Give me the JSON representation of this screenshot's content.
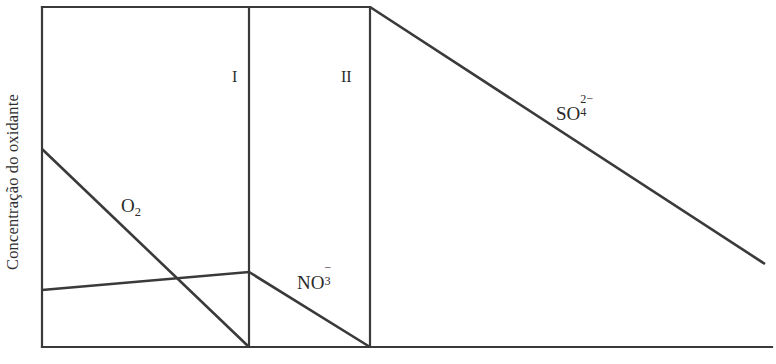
{
  "figure": {
    "background_color": "#ffffff",
    "line_color": "#3a3a3a",
    "text_color": "#2e2e2e",
    "y_axis_title": "Concentração do oxidante",
    "x_axis_title": ""
  },
  "zones": [
    {
      "name": "zone-1",
      "label": "I",
      "x": 232,
      "y": 68
    },
    {
      "name": "zone-2",
      "label": "II",
      "x": 341,
      "y": 68
    }
  ],
  "curve_labels": [
    {
      "name": "o2",
      "base": "O",
      "sub": "2",
      "sup": "",
      "x": 121,
      "y": 196
    },
    {
      "name": "no3",
      "base": "NO",
      "sub": "3",
      "sup": "−",
      "x": 297,
      "y": 270
    },
    {
      "name": "so4",
      "base": "SO",
      "sub": "4",
      "sup": "2−",
      "x": 556,
      "y": 101
    }
  ],
  "chart_data": {
    "type": "line",
    "title": "",
    "xlabel": "",
    "ylabel": "Concentração do oxidante",
    "grid": false,
    "legend": "inline-labels",
    "axes": {
      "x_axis": {
        "x_start": 42,
        "x_end": 772,
        "y": 347,
        "ticks": [],
        "tick_labels": []
      },
      "y_axis": {
        "x": 42,
        "y_top": 7,
        "y_bottom": 347,
        "ticks": [],
        "tick_labels": []
      }
    },
    "frame": {
      "top_line": {
        "x1": 42,
        "y1": 7,
        "x2": 370,
        "y2": 7
      },
      "left_line": {
        "x1": 42,
        "y1": 7,
        "x2": 42,
        "y2": 347
      },
      "bottom_line": {
        "x1": 42,
        "y1": 347,
        "x2": 772,
        "y2": 347
      },
      "divider_1": {
        "x1": 249,
        "y1": 7,
        "x2": 249,
        "y2": 347
      },
      "divider_2": {
        "x1": 370,
        "y1": 7,
        "x2": 370,
        "y2": 347
      }
    },
    "series": [
      {
        "name": "O₂",
        "label_base": "O",
        "label_sub": "2",
        "points": [
          [
            42,
            149
          ],
          [
            249,
            347
          ]
        ],
        "description": "declines from moderate concentration at left edge to zero at boundary I"
      },
      {
        "name": "NO₃⁻",
        "label_base": "NO",
        "label_sub": "3",
        "label_sup": "−",
        "points": [
          [
            42,
            290
          ],
          [
            249,
            272
          ],
          [
            370,
            347
          ]
        ],
        "description": "rises slightly across zone before boundary I, then declines to zero at boundary II"
      },
      {
        "name": "SO₄²⁻",
        "label_base": "SO",
        "label_sub": "4",
        "label_sup": "2−",
        "points": [
          [
            370,
            7
          ],
          [
            765,
            264
          ]
        ],
        "description": "declines steadily from maximum at boundary II toward the right edge"
      }
    ]
  }
}
